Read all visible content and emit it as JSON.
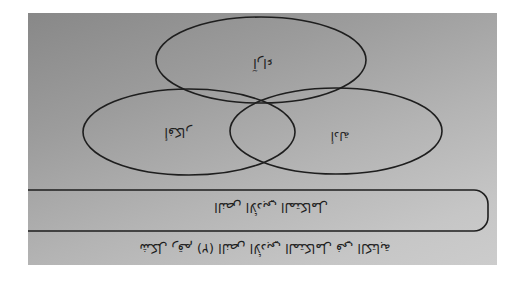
{
  "figure": {
    "orientation": "rotated-180",
    "circles": [
      {
        "id": "top",
        "label": "آراء"
      },
      {
        "id": "left",
        "label": "أفكار"
      },
      {
        "id": "right",
        "label": "أدلة"
      }
    ],
    "box": {
      "label": "النص الأدبي المتكامل"
    },
    "caption": "شكل رقم (٢) النص الأدبي المتكامل في الكتابة"
  },
  "colors": {
    "stroke": "#1e1e1e",
    "background_dark": "#888888",
    "background_light": "#cccccc",
    "page": "#ffffff"
  }
}
